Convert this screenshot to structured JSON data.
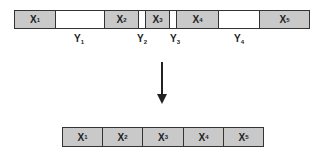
{
  "diagram": {
    "top_bar": {
      "segments": [
        {
          "type": "x",
          "label": "X",
          "sub": "1",
          "width": 41
        },
        {
          "type": "y",
          "label": "Y",
          "sub": "1",
          "width": 49
        },
        {
          "type": "x",
          "label": "X",
          "sub": "2",
          "width": 34
        },
        {
          "type": "y",
          "label": "Y",
          "sub": "2",
          "width": 7
        },
        {
          "type": "x",
          "label": "X",
          "sub": "3",
          "width": 24
        },
        {
          "type": "y",
          "label": "Y",
          "sub": "3",
          "width": 7
        },
        {
          "type": "x",
          "label": "X",
          "sub": "4",
          "width": 42
        },
        {
          "type": "y",
          "label": "Y",
          "sub": "4",
          "width": 41
        },
        {
          "type": "x",
          "label": "X",
          "sub": "5",
          "width": 50
        }
      ],
      "gap_labels": [
        {
          "label": "Y",
          "sub": "1",
          "x": 79
        },
        {
          "label": "Y",
          "sub": "2",
          "x": 142
        },
        {
          "label": "Y",
          "sub": "3",
          "x": 173
        },
        {
          "label": "Y",
          "sub": "4",
          "x": 239
        }
      ]
    },
    "arrow": {
      "direction": "down"
    },
    "bottom_bar": {
      "segments": [
        {
          "label": "X",
          "sub": "1"
        },
        {
          "label": "X",
          "sub": "2"
        },
        {
          "label": "X",
          "sub": "3"
        },
        {
          "label": "X",
          "sub": "4"
        },
        {
          "label": "X",
          "sub": "5"
        }
      ]
    },
    "colors": {
      "filled": "#c9c9c9",
      "empty": "#ffffff",
      "border": "#333333"
    }
  }
}
